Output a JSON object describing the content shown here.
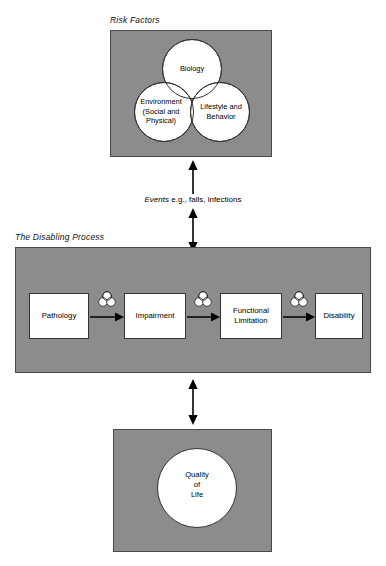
{
  "diagram": {
    "title_risk": "Risk Factors",
    "title_process": "The Disabling Process",
    "events_emphasis": "Events",
    "events_rest": " e.g., falls, infections",
    "colors": {
      "panel_gray": "#8c8c8c",
      "circle_white": "#ffffff",
      "stroke": "#333333",
      "text": "#000000"
    }
  },
  "risk_factors": {
    "venn": [
      {
        "id": "biology",
        "label": "Biology"
      },
      {
        "id": "environment",
        "label": "Environment\n(Social and\nPhysical)"
      },
      {
        "id": "lifestyle",
        "label": "Lifestyle and\nBehavior"
      }
    ]
  },
  "disabling_process": {
    "steps": [
      {
        "id": "pathology",
        "label": "Pathology"
      },
      {
        "id": "impairment",
        "label": "Impairment"
      },
      {
        "id": "functional-limitation",
        "label": "Functional\nLimitation"
      },
      {
        "id": "disability",
        "label": "Disability"
      }
    ],
    "connector_icons": [
      "venn-icon",
      "venn-icon",
      "venn-icon"
    ]
  },
  "quality_of_life": {
    "label": "Quality\nof\nLife"
  }
}
